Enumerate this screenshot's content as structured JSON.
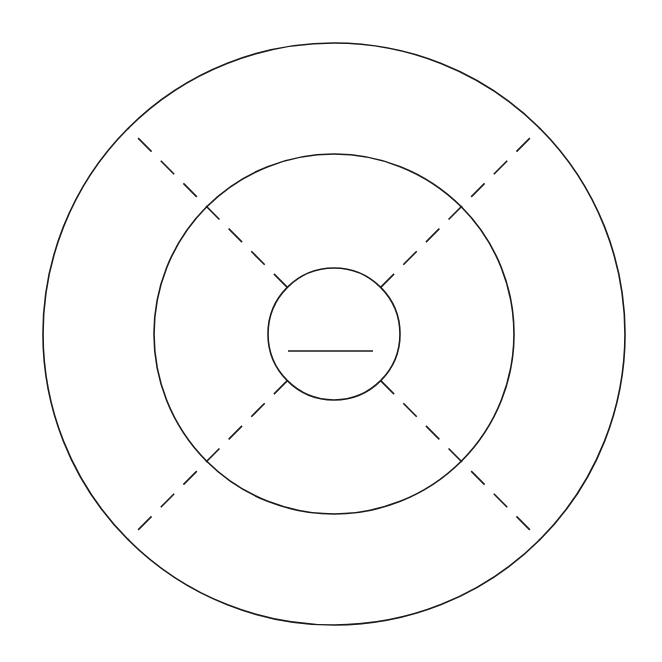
{
  "canvas": {
    "width": 662,
    "height": 662,
    "background": "#ffffff"
  },
  "diagram": {
    "type": "concentric-circles-with-radial-dividers",
    "center": [
      334,
      334
    ],
    "stroke_color": "#1a1a1a",
    "stroke_width": 1.6,
    "circles": [
      {
        "name": "outer-ring",
        "r": 291
      },
      {
        "name": "middle-ring",
        "r": 180
      },
      {
        "name": "inner-circle",
        "r": 66
      }
    ],
    "dividers": {
      "style": "dashed",
      "dash": "19,13",
      "angles_deg": [
        45,
        135,
        225,
        315
      ],
      "from_r": 66,
      "to_r": 291
    },
    "center_bar": {
      "x1": 288,
      "x2": 373,
      "y": 351
    }
  }
}
